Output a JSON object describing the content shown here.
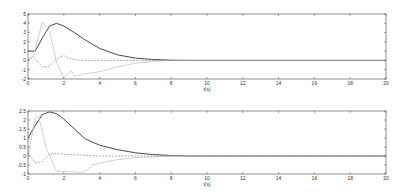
{
  "chart_data": [
    {
      "type": "line",
      "title": "",
      "xlabel": "t(s)",
      "ylabel": "",
      "xlim": [
        0,
        20
      ],
      "ylim": [
        -2,
        5
      ],
      "xticks": [
        "0",
        "2",
        "4",
        "6",
        "8",
        "10",
        "12",
        "14",
        "16",
        "18",
        "20"
      ],
      "yticks": [
        "5",
        "4",
        "3",
        "2",
        "1",
        "0",
        "-1",
        "-2"
      ],
      "grid": false,
      "legend": null,
      "series": [
        {
          "name": "solid-dark",
          "style": "solid",
          "color": "#333333",
          "x": [
            0,
            0.4,
            0.8,
            1.2,
            1.6,
            2.0,
            2.6,
            3.2,
            4.0,
            5.0,
            6.0,
            7.0,
            8.0,
            9.0,
            10.0,
            20.0
          ],
          "values": [
            1.0,
            1.0,
            2.4,
            3.7,
            4.0,
            3.7,
            3.0,
            2.2,
            1.3,
            0.6,
            0.25,
            0.1,
            0.02,
            0.0,
            0.0,
            0.0
          ]
        },
        {
          "name": "light-spike",
          "style": "solid",
          "color": "#bbbbbb",
          "x": [
            0,
            0.3,
            0.8,
            1.2,
            1.6,
            2.0,
            2.4,
            2.6,
            3.0,
            4.0,
            5.0,
            6.0,
            7.0,
            8.0,
            10.0,
            20.0
          ],
          "values": [
            0.0,
            0.5,
            4.1,
            3.2,
            -0.2,
            -1.9,
            -1.1,
            -1.7,
            -1.5,
            -1.2,
            -0.7,
            -0.3,
            -0.1,
            0.0,
            0.0,
            0.0
          ]
        },
        {
          "name": "dashed",
          "style": "dashed",
          "color": "#888888",
          "x": [
            0,
            0.3,
            0.8,
            1.2,
            1.6,
            2.0,
            2.5,
            3.0,
            4.0,
            6.0,
            8.0,
            10.0,
            20.0
          ],
          "values": [
            0.0,
            0.4,
            -0.7,
            -0.6,
            0.2,
            0.5,
            0.1,
            0.0,
            0.0,
            0.0,
            0.0,
            0.0,
            0.0
          ]
        }
      ]
    },
    {
      "type": "line",
      "title": "",
      "xlabel": "t(s)",
      "ylabel": "",
      "xlim": [
        0,
        20
      ],
      "ylim": [
        -1,
        2.5
      ],
      "xticks": [
        "0",
        "2",
        "4",
        "6",
        "8",
        "10",
        "12",
        "14",
        "16",
        "18",
        "20"
      ],
      "yticks": [
        "2.5",
        "2",
        "1.5",
        "1",
        "0.5",
        "0",
        "-0.5",
        "-1"
      ],
      "grid": false,
      "legend": null,
      "series": [
        {
          "name": "solid-dark",
          "style": "solid",
          "color": "#333333",
          "x": [
            0,
            0.4,
            0.8,
            1.2,
            1.6,
            2.0,
            2.6,
            3.2,
            4.0,
            5.0,
            6.0,
            7.0,
            8.0,
            9.0,
            20.0
          ],
          "values": [
            1.0,
            1.7,
            2.3,
            2.45,
            2.35,
            2.05,
            1.5,
            0.95,
            0.6,
            0.35,
            0.18,
            0.08,
            0.03,
            0.0,
            0.0
          ]
        },
        {
          "name": "light-spike",
          "style": "solid",
          "color": "#bbbbbb",
          "x": [
            0,
            0.4,
            0.6,
            1.0,
            1.6,
            2.0,
            3.0,
            3.2,
            3.6,
            4.0,
            5.0,
            6.0,
            8.0,
            10.0,
            20.0
          ],
          "values": [
            0.0,
            2.1,
            2.2,
            0.5,
            -0.85,
            -0.85,
            -0.9,
            -0.85,
            -0.5,
            -0.4,
            -0.2,
            -0.1,
            0.0,
            0.0,
            0.0
          ]
        },
        {
          "name": "dashed",
          "style": "dashed",
          "color": "#888888",
          "x": [
            0,
            0.4,
            0.8,
            1.2,
            1.6,
            2.0,
            3.0,
            4.0,
            6.0,
            8.0,
            10.0,
            20.0
          ],
          "values": [
            0.2,
            -0.4,
            -0.3,
            0.1,
            0.15,
            0.1,
            0.05,
            0.0,
            0.0,
            0.0,
            0.0,
            0.0
          ]
        }
      ]
    }
  ]
}
